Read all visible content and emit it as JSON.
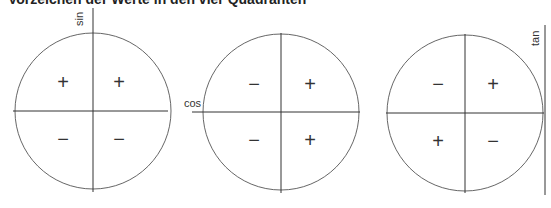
{
  "title": "Vorzeichen der Werte in den vier Quadranten",
  "diagrams": [
    {
      "name": "sin",
      "axis_label": "sin",
      "quadrants": {
        "q2": "+",
        "q1": "+",
        "q3": "−",
        "q4": "−"
      }
    },
    {
      "name": "cos",
      "axis_label": "cos",
      "quadrants": {
        "q2": "−",
        "q1": "+",
        "q3": "−",
        "q4": "+"
      }
    },
    {
      "name": "tan",
      "axis_label": "tan",
      "quadrants": {
        "q2": "−",
        "q1": "+",
        "q3": "+",
        "q4": "−"
      }
    }
  ]
}
